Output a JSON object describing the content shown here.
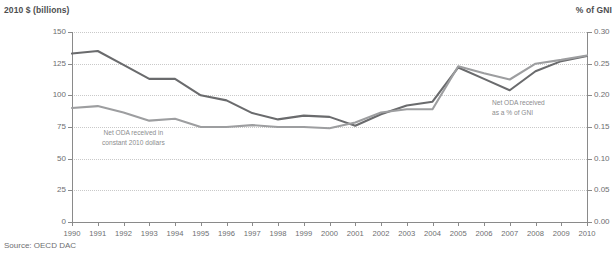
{
  "left_axis_title": "2010 $ (billions)",
  "right_axis_title": "% of GNI",
  "source": "Source: OECD DAC",
  "annotations": {
    "dollars": "Net ODA received in\nconstant 2010 dollars",
    "gni": "Net ODA received\nas a % of GNI"
  },
  "colors": {
    "dollars_line": "#6a6b6d",
    "gni_line": "#9d9ea0",
    "grid": "#c9c9c9",
    "axis": "#8a8a8a",
    "text": "#6d6e70"
  },
  "chart_data": {
    "type": "line",
    "title": "",
    "xlabel": "",
    "ylabel": "2010 $ (billions)",
    "y2label": "% of GNI",
    "grid": true,
    "legend": "annotations",
    "x": [
      1990,
      1991,
      1992,
      1993,
      1994,
      1995,
      1996,
      1997,
      1998,
      1999,
      2000,
      2001,
      2002,
      2003,
      2004,
      2005,
      2006,
      2007,
      2008,
      2009,
      2010
    ],
    "xtick_labels": [
      "1990",
      "1991",
      "1992",
      "1993",
      "1994",
      "1995",
      "1996",
      "1997",
      "1998",
      "1999",
      "2000",
      "2001",
      "2002",
      "2003",
      "2004",
      "2005",
      "2006",
      "2007",
      "2008",
      "2009",
      "2010"
    ],
    "ylim": [
      0,
      150
    ],
    "ytick_labels": [
      "0",
      "25",
      "50",
      "75",
      "100",
      "125",
      "150"
    ],
    "ytick_values": [
      0,
      25,
      50,
      75,
      100,
      125,
      150
    ],
    "y2lim": [
      0,
      0.3
    ],
    "y2tick_labels": [
      "0.00",
      "0.05",
      "0.10",
      "0.15",
      "0.20",
      "0.25",
      "0.30"
    ],
    "y2tick_values": [
      0,
      0.05,
      0.1,
      0.15,
      0.2,
      0.25,
      0.3
    ],
    "series": [
      {
        "name": "Net ODA received in constant 2010 dollars",
        "axis": "left",
        "color": "#6a6b6d",
        "values": [
          133,
          135,
          124,
          113,
          113,
          100,
          96,
          86,
          81,
          84,
          83,
          76,
          85,
          92,
          95,
          122,
          113,
          104,
          119,
          127,
          131
        ]
      },
      {
        "name": "Net ODA received as a % of GNI",
        "axis": "right",
        "color": "#9d9ea0",
        "values": [
          0.18,
          0.183,
          0.173,
          0.16,
          0.163,
          0.15,
          0.15,
          0.153,
          0.15,
          0.15,
          0.148,
          0.157,
          0.173,
          0.178,
          0.178,
          0.246,
          0.235,
          0.225,
          0.25,
          0.256,
          0.263
        ]
      }
    ]
  }
}
